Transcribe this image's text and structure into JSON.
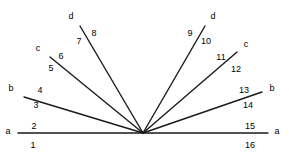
{
  "figure": {
    "type": "geometry-diagram",
    "background_color": "#ffffff",
    "stroke_color": "#1a1a1a",
    "text_color": "#000000",
    "canvas": {
      "width": 289,
      "height": 155
    },
    "vertex": {
      "x": 143,
      "y": 133
    },
    "rays": [
      {
        "id": "ray-a-left",
        "letter": "a",
        "letter_pos": {
          "x": 8,
          "y": 131
        },
        "endpoint": {
          "x": 18,
          "y": 133
        },
        "numbers": [
          {
            "text": "2",
            "x": 34,
            "y": 126
          },
          {
            "text": "1",
            "x": 33,
            "y": 145
          }
        ]
      },
      {
        "id": "ray-b-left",
        "letter": "b",
        "letter_pos": {
          "x": 11,
          "y": 88
        },
        "endpoint": {
          "x": 24,
          "y": 97
        },
        "numbers": [
          {
            "text": "4",
            "x": 40,
            "y": 90
          },
          {
            "text": "3",
            "x": 36,
            "y": 105
          }
        ]
      },
      {
        "id": "ray-c-left",
        "letter": "c",
        "letter_pos": {
          "x": 38,
          "y": 48
        },
        "endpoint": {
          "x": 50,
          "y": 57
        },
        "numbers": [
          {
            "text": "6",
            "x": 61,
            "y": 56
          },
          {
            "text": "5",
            "x": 51,
            "y": 68
          }
        ]
      },
      {
        "id": "ray-d-left",
        "letter": "d",
        "letter_pos": {
          "x": 71,
          "y": 16
        },
        "endpoint": {
          "x": 80,
          "y": 26
        },
        "numbers": [
          {
            "text": "7",
            "x": 79,
            "y": 41
          },
          {
            "text": "8",
            "x": 94,
            "y": 33
          }
        ]
      },
      {
        "id": "ray-d-right",
        "letter": "d",
        "letter_pos": {
          "x": 213,
          "y": 16
        },
        "endpoint": {
          "x": 205,
          "y": 26
        },
        "numbers": [
          {
            "text": "9",
            "x": 190,
            "y": 33
          },
          {
            "text": "10",
            "x": 206,
            "y": 41
          }
        ]
      },
      {
        "id": "ray-c-right",
        "letter": "c",
        "letter_pos": {
          "x": 246,
          "y": 44
        },
        "endpoint": {
          "x": 237,
          "y": 52
        },
        "numbers": [
          {
            "text": "11",
            "x": 221,
            "y": 57
          },
          {
            "text": "12",
            "x": 236,
            "y": 69
          }
        ]
      },
      {
        "id": "ray-b-right",
        "letter": "b",
        "letter_pos": {
          "x": 272,
          "y": 88
        },
        "endpoint": {
          "x": 262,
          "y": 92
        },
        "numbers": [
          {
            "text": "13",
            "x": 244,
            "y": 90
          },
          {
            "text": "14",
            "x": 248,
            "y": 105
          }
        ]
      },
      {
        "id": "ray-a-right",
        "letter": "a",
        "letter_pos": {
          "x": 277,
          "y": 131
        },
        "endpoint": {
          "x": 268,
          "y": 133
        },
        "numbers": [
          {
            "text": "15",
            "x": 250,
            "y": 126
          },
          {
            "text": "16",
            "x": 250,
            "y": 145
          }
        ]
      }
    ]
  }
}
